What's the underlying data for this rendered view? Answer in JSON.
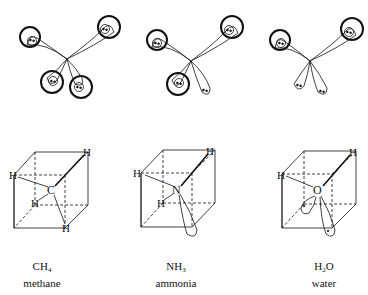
{
  "figure": {
    "molecules": [
      {
        "formula_main": "CH",
        "formula_sub": "4",
        "formula_tail": "",
        "name": "methane",
        "central_atom": "C",
        "bonding_orbitals": 4,
        "lone_pairs": 0,
        "atom_labels": [
          "H",
          "H",
          "H",
          "H"
        ]
      },
      {
        "formula_main": "NH",
        "formula_sub": "3",
        "formula_tail": "",
        "name": "ammonia",
        "central_atom": "N",
        "bonding_orbitals": 3,
        "lone_pairs": 1,
        "atom_labels": [
          "H",
          "H",
          "H"
        ]
      },
      {
        "formula_main": "H",
        "formula_sub": "2",
        "formula_tail": "O",
        "name": "water",
        "central_atom": "O",
        "bonding_orbitals": 2,
        "lone_pairs": 2,
        "atom_labels": [
          "H",
          "H"
        ]
      }
    ]
  }
}
